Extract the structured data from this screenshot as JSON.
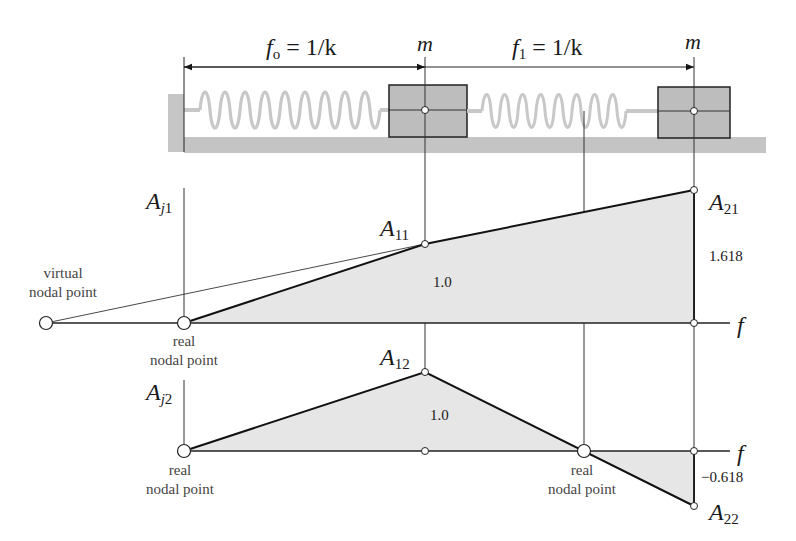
{
  "dimensions": {
    "f0_label": "f",
    "f0_sub": "o",
    "f0_value": " = 1/k",
    "f1_label": "f",
    "f1_sub": "1",
    "f1_value": " = 1/k",
    "mass1_label": "m",
    "mass2_label": "m"
  },
  "mode1": {
    "axis_label": "A",
    "axis_sub_italic": "j",
    "axis_sub": "1",
    "point1_label": "A",
    "point1_sub": "11",
    "point1_value": "1.0",
    "point2_label": "A",
    "point2_sub": "21",
    "point2_value": "1.618",
    "f_axis_label": "f",
    "virtual_node_line1": "virtual",
    "virtual_node_line2": "nodal point",
    "real_node_line1": "real",
    "real_node_line2": "nodal point"
  },
  "mode2": {
    "axis_label": "A",
    "axis_sub_italic": "j",
    "axis_sub": "2",
    "point1_label": "A",
    "point1_sub": "12",
    "point1_value": "1.0",
    "point2_label": "A",
    "point2_sub": "22",
    "point2_value": "−0.618",
    "f_axis_label": "f",
    "left_node_line1": "real",
    "left_node_line2": "nodal point",
    "mid_node_line1": "real",
    "mid_node_line2": "nodal point"
  },
  "colors": {
    "line": "#1a1a1a",
    "fill": "#e6e6e6",
    "mass_fill": "#bdbdbd",
    "ground_fill": "#c4c4c4",
    "spring": "#c8c8c8"
  }
}
